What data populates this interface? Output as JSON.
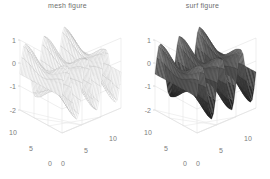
{
  "figure": {
    "background": "#ffffff",
    "axis_color": "#d8d8d8",
    "tick_color": "#7d7d7d",
    "title_color": "#6e6e6e"
  },
  "panels": [
    {
      "id": "mesh",
      "title": "mesh figure",
      "style": "wireframe",
      "line_color": "#9a9a9a",
      "face_color": "#ffffff",
      "face_opacity": 0.92
    },
    {
      "id": "surf",
      "title": "surf figure",
      "style": "shaded-surface",
      "line_color": "#2b2b2b",
      "face_color": "#4a4a4a",
      "face_opacity": 1.0
    }
  ],
  "chart_data": {
    "type": "surface",
    "subtitle": "",
    "xlabel": "",
    "ylabel": "",
    "zlabel": "",
    "xlim": [
      0,
      10
    ],
    "ylim": [
      0,
      10
    ],
    "zlim": [
      -2.5,
      1.2
    ],
    "xticks": [
      0,
      5,
      10
    ],
    "yticks": [
      0,
      5,
      10
    ],
    "zticks": [
      1,
      0,
      -1,
      -2
    ],
    "xticklabels": [
      "0",
      "5",
      "10"
    ],
    "yticklabels": [
      "0",
      "5",
      "10"
    ],
    "zticklabels": [
      "1",
      "0",
      "-1",
      "-2"
    ],
    "grid": true,
    "legend": "none",
    "view_azimuth": -37.5,
    "view_elevation": 30,
    "surface_function": "ripple: z = sin(x) * cos(y) style periodic wave",
    "x_samples": 33,
    "y_samples": 33,
    "wave_periods_x": 3,
    "wave_periods_y": 1,
    "z_min_observed": -2.3,
    "z_max_observed": 1.1
  },
  "ticks": {
    "z": [
      "1",
      "0",
      "-1",
      "-2"
    ],
    "left_axis": [
      "10",
      "5",
      "0"
    ],
    "right_axis": [
      "0",
      "5",
      "10"
    ]
  }
}
